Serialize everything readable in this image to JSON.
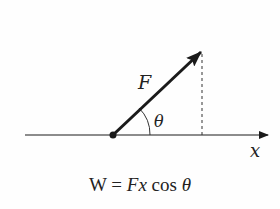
{
  "diagram": {
    "force_label": "F",
    "angle_label": "θ",
    "axis_label": "x",
    "equation": {
      "lhs": "W",
      "equals": "=",
      "F": "F",
      "x": "x",
      "cos": "cos",
      "theta": "θ"
    }
  },
  "colors": {
    "line": "#1a1a1a",
    "background": "#fefefe"
  }
}
